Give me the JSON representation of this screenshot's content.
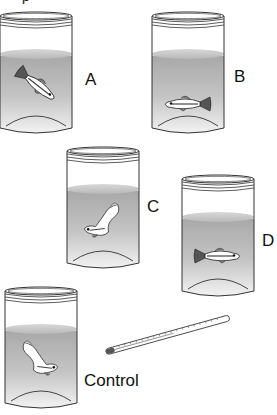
{
  "figure": {
    "top_fragment": "p",
    "jars": [
      {
        "id": "A",
        "label": "A",
        "fish_pose": "head-down diagonal"
      },
      {
        "id": "B",
        "label": "B",
        "fish_pose": "horizontal facing left"
      },
      {
        "id": "C",
        "label": "C",
        "fish_pose": "curled, head down-left"
      },
      {
        "id": "D",
        "label": "D",
        "fish_pose": "horizontal facing right"
      },
      {
        "id": "control",
        "label": "Control",
        "fish_pose": "curled, head right"
      }
    ],
    "thermometer": {
      "name": "thermometer"
    }
  },
  "colors": {
    "outline": "#333333",
    "water_top": "#a8a8a8",
    "water_bottom": "#f0f0f0",
    "fish_body": "#ffffff",
    "fish_fin": "#555555"
  }
}
